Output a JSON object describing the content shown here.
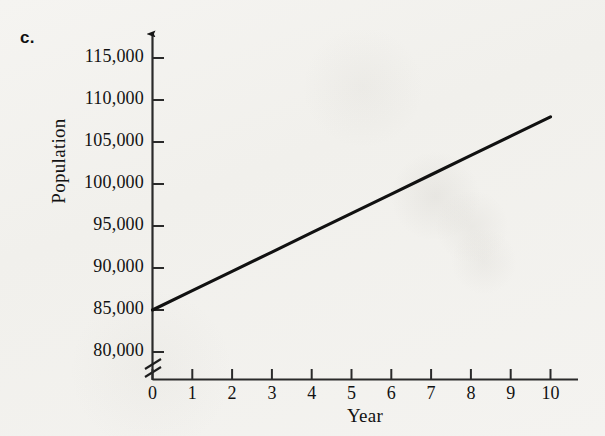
{
  "figure": {
    "panel_label": "c.",
    "background_color": "#f3f2ef",
    "ink_color": "#121212"
  },
  "chart_data": {
    "type": "line",
    "title": "",
    "subtitle": "",
    "xlabel": "Year",
    "ylabel": "Population",
    "grid": false,
    "legend": null,
    "legend_position": "none",
    "axis_break_y": true,
    "axis_arrows": true,
    "xlim": [
      0,
      10
    ],
    "ylim": [
      80000,
      115000
    ],
    "x_tick_labels": [
      "0",
      "1",
      "2",
      "3",
      "4",
      "5",
      "6",
      "7",
      "8",
      "9",
      "10"
    ],
    "x_ticks": [
      0,
      1,
      2,
      3,
      4,
      5,
      6,
      7,
      8,
      9,
      10
    ],
    "y_tick_labels": [
      "80,000",
      "85,000",
      "90,000",
      "95,000",
      "100,000",
      "105,000",
      "110,000",
      "115,000"
    ],
    "y_ticks": [
      80000,
      85000,
      90000,
      95000,
      100000,
      105000,
      110000,
      115000
    ],
    "series": [
      {
        "name": "Population",
        "color": "#111111",
        "x": [
          0,
          1,
          2,
          3,
          4,
          5,
          6,
          7,
          8,
          9,
          10
        ],
        "values": [
          85000,
          87300,
          89600,
          91900,
          94200,
          96500,
          98800,
          101100,
          103400,
          105700,
          108000
        ]
      }
    ],
    "annotations": []
  }
}
